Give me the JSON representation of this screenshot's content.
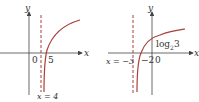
{
  "diagrams": [
    {
      "title": "Graph with vertical asymptote x = 4",
      "axis_x_label": "x",
      "axis_y_label": "y",
      "origin_label": "0",
      "x_intercept_label": "5",
      "asymptote_label": "x = 4"
    },
    {
      "title": "Graph with vertical asymptote x = -3",
      "axis_x_label": "x",
      "axis_y_label": "y",
      "origin_label": "0",
      "x_intercept_label": "−2",
      "y_intercept_label": "log",
      "y_intercept_sub": "2",
      "y_intercept_arg": "3",
      "asymptote_label": "x = −3"
    }
  ],
  "colors": {
    "curve": "#a8403a",
    "asymptote": "#a8403a",
    "axis": "#444444"
  }
}
